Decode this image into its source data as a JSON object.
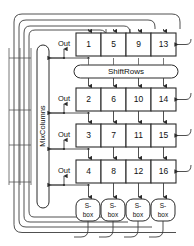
{
  "diagram": {
    "type": "block-diagram",
    "colors": {
      "background": "#ffffff",
      "wire": "#3c3c3c",
      "box_stroke": "#2b2b2b",
      "box_fill": "#ffffff",
      "text": "#111111"
    },
    "state_matrix": {
      "rows": [
        {
          "label": "row-1",
          "cells": [
            "1",
            "5",
            "9",
            "13"
          ],
          "out_label": "Out"
        },
        {
          "label": "row-2",
          "cells": [
            "2",
            "6",
            "10",
            "14"
          ],
          "out_label": "Out"
        },
        {
          "label": "row-3",
          "cells": [
            "3",
            "7",
            "11",
            "15"
          ],
          "out_label": "Out"
        },
        {
          "label": "row-4",
          "cells": [
            "4",
            "8",
            "12",
            "16"
          ],
          "out_label": "Out"
        }
      ]
    },
    "shiftrows": {
      "label": "ShiftRows"
    },
    "mixcolumns": {
      "label": "MixColumns"
    },
    "sboxes": [
      {
        "line1": "S-",
        "line2": "box"
      },
      {
        "line1": "S-",
        "line2": "box"
      },
      {
        "line1": "S-",
        "line2": "box"
      },
      {
        "line1": "S-",
        "line2": "box"
      }
    ]
  }
}
